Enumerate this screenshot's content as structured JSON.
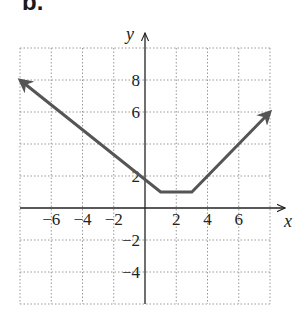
{
  "panel_label": "b.",
  "chart_data": {
    "type": "line",
    "title": "",
    "xlabel": "x",
    "ylabel": "y",
    "xlim": [
      -8,
      8
    ],
    "ylim": [
      -6,
      10
    ],
    "grid": true,
    "grid_step": 2,
    "x_ticks": [
      -6,
      -4,
      -2,
      2,
      4,
      6
    ],
    "y_ticks": [
      8,
      6,
      2,
      -2,
      -4
    ],
    "series": [
      {
        "name": "piecewise",
        "points": [
          [
            -8,
            8
          ],
          [
            1,
            1
          ],
          [
            3,
            1
          ],
          [
            8,
            6
          ]
        ],
        "arrow_start": true,
        "arrow_end": true,
        "color": "#555555"
      }
    ]
  }
}
